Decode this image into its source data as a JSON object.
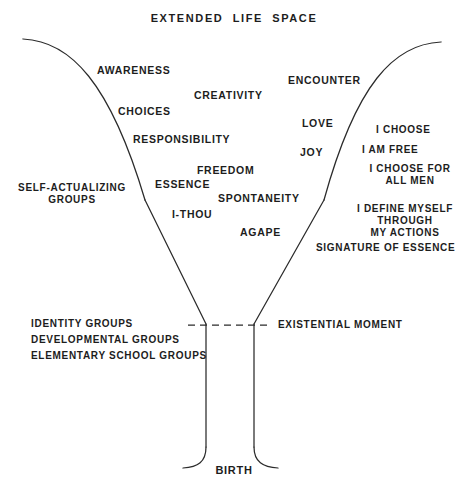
{
  "diagram": {
    "title": "EXTENDED  LIFE  SPACE",
    "bottom_label": "BIRTH",
    "existential_label": "EXISTENTIAL MOMENT",
    "colors": {
      "ink": "#1d1d1d",
      "stroke": "#2b2b2b",
      "background": "#ffffff"
    },
    "left_outer_labels": [
      {
        "text": "SELF-ACTUALIZING\nGROUPS",
        "x": 72,
        "y": 182,
        "align": "c",
        "size": "sz-s"
      }
    ],
    "left_group_labels": [
      {
        "text": "IDENTITY GROUPS",
        "x": 31,
        "y": 318,
        "align": "l",
        "size": "sz-s"
      },
      {
        "text": "DEVELOPMENTAL GROUPS",
        "x": 31,
        "y": 334,
        "align": "l",
        "size": "sz-s"
      },
      {
        "text": "ELEMENTARY SCHOOL GROUPS",
        "x": 31,
        "y": 350,
        "align": "l",
        "size": "sz-s"
      }
    ],
    "inner_labels": [
      {
        "text": "AWARENESS",
        "x": 97,
        "y": 64,
        "align": "l",
        "size": "sz-m"
      },
      {
        "text": "CHOICES",
        "x": 118,
        "y": 105,
        "align": "l",
        "size": "sz-m"
      },
      {
        "text": "RESPONSIBILITY",
        "x": 133,
        "y": 133,
        "align": "l",
        "size": "sz-m"
      },
      {
        "text": "CREATIVITY",
        "x": 194,
        "y": 89,
        "align": "l",
        "size": "sz-m"
      },
      {
        "text": "ESSENCE",
        "x": 155,
        "y": 178,
        "align": "l",
        "size": "sz-m"
      },
      {
        "text": "FREEDOM",
        "x": 197,
        "y": 164,
        "align": "l",
        "size": "sz-m"
      },
      {
        "text": "I-THOU",
        "x": 172,
        "y": 208,
        "align": "l",
        "size": "sz-m"
      },
      {
        "text": "SPONTANEITY",
        "x": 218,
        "y": 192,
        "align": "l",
        "size": "sz-m"
      },
      {
        "text": "AGAPE",
        "x": 240,
        "y": 226,
        "align": "l",
        "size": "sz-m"
      },
      {
        "text": "ENCOUNTER",
        "x": 288,
        "y": 74,
        "align": "l",
        "size": "sz-m"
      },
      {
        "text": "LOVE",
        "x": 302,
        "y": 117,
        "align": "l",
        "size": "sz-m"
      },
      {
        "text": "JOY",
        "x": 300,
        "y": 146,
        "align": "l",
        "size": "sz-m"
      }
    ],
    "right_outer_labels": [
      {
        "text": "I CHOOSE",
        "x": 376,
        "y": 124,
        "align": "l",
        "size": "sz-s"
      },
      {
        "text": "I AM FREE",
        "x": 362,
        "y": 144,
        "align": "l",
        "size": "sz-s"
      },
      {
        "text": "I CHOOSE FOR\nALL MEN",
        "x": 410,
        "y": 163,
        "align": "c",
        "size": "sz-s"
      },
      {
        "text": "I DEFINE MYSELF\nTHROUGH\nMY ACTIONS",
        "x": 405,
        "y": 203,
        "align": "c",
        "size": "sz-s"
      },
      {
        "text": "SIGNATURE OF ESSENCE",
        "x": 316,
        "y": 242,
        "align": "l",
        "size": "sz-s"
      }
    ]
  }
}
